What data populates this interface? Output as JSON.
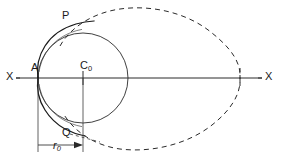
{
  "figure": {
    "type": "geometric-diagram",
    "width": 281,
    "height": 164,
    "background_color": "#ffffff",
    "stroke_color": "#1a1a1a",
    "labels": {
      "axis_left": "X",
      "axis_right": "X",
      "cusp_point": "A",
      "center_point": "C",
      "center_point_sub": "0",
      "upper_point": "P",
      "lower_point": "Q",
      "radius_dim": "r",
      "radius_dim_sub": "0"
    },
    "geometry": {
      "axis": {
        "y": 78,
        "x_start": 16,
        "x_end": 262,
        "style": "solid"
      },
      "base_circle": {
        "center_x": 83,
        "center_y": 78,
        "radius": 45,
        "style": "solid"
      },
      "inner_curve": {
        "description": "solid cardioid arc from cusp A through P and Q",
        "style": "solid",
        "cusp_x": 38,
        "cusp_y": 78
      },
      "outer_curve": {
        "description": "dashed cardioid / limacon outline",
        "style": "dashed",
        "dash_pattern": "5,4",
        "right_crossing_x": 240,
        "top_y": 8,
        "bottom_y": 152
      },
      "dimension": {
        "label": "r0",
        "from_x": 38,
        "to_x": 83,
        "y": 145,
        "arrow": "right",
        "extension_top_y": 78
      },
      "points": {
        "A": {
          "x": 38,
          "y": 78
        },
        "C0": {
          "x": 83,
          "y": 78
        },
        "P": {
          "x": 76,
          "y": 24
        },
        "Q": {
          "x": 72,
          "y": 131
        }
      }
    }
  }
}
